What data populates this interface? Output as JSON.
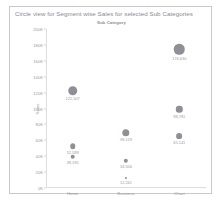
{
  "chart_data": {
    "type": "scatter",
    "title": "Circle view for Segment wise Sales for selected Sub Categories",
    "subtitle": "Sub Category",
    "xlabel": "",
    "ylabel": "Sales",
    "categories": [
      "Home",
      "Business",
      "Chart"
    ],
    "ylim": [
      0,
      200000
    ],
    "yticks": [
      {
        "label": "200K",
        "value": 200000
      },
      {
        "label": "180K",
        "value": 180000
      },
      {
        "label": "160K",
        "value": 160000
      },
      {
        "label": "140K",
        "value": 140000
      },
      {
        "label": "120K",
        "value": 120000
      },
      {
        "label": "100K",
        "value": 100000
      },
      {
        "label": "80K",
        "value": 80000
      },
      {
        "label": "60K",
        "value": 60000
      },
      {
        "label": "40K",
        "value": 40000
      },
      {
        "label": "20K",
        "value": 20000
      },
      {
        "label": "0K",
        "value": 0
      }
    ],
    "grid": false,
    "legend": "none",
    "marker_color": "#8f8f96",
    "points": [
      {
        "category": "Home",
        "value": 122507,
        "label": "122,507",
        "size": 9.5
      },
      {
        "category": "Home",
        "value": 52599,
        "label": "52,599",
        "size": 5.5
      },
      {
        "category": "Home",
        "value": 39195,
        "label": "39,195",
        "size": 4.6
      },
      {
        "category": "Business",
        "value": 69119,
        "label": "69,119",
        "size": 7.4
      },
      {
        "category": "Business",
        "value": 34506,
        "label": "34,506",
        "size": 4.4
      },
      {
        "category": "Business",
        "value": 12241,
        "label": "12,241",
        "size": 2.2
      },
      {
        "category": "Chart",
        "value": 174630,
        "label": "174,630",
        "size": 10.5
      },
      {
        "category": "Chart",
        "value": 98781,
        "label": "98,781",
        "size": 6.4
      },
      {
        "category": "Chart",
        "value": 65141,
        "label": "65,141",
        "size": 5.8
      }
    ]
  }
}
